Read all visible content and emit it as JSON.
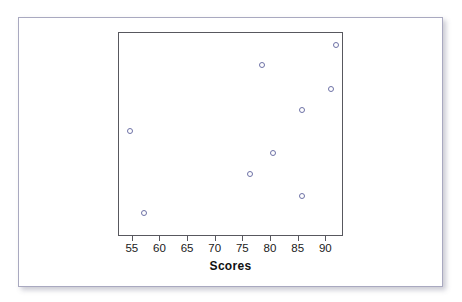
{
  "chart_data": {
    "type": "scatter",
    "title": "",
    "xlabel": "Scores",
    "ylabel": "",
    "xlim": [
      52.5,
      93.2
    ],
    "ylim": [
      0,
      100
    ],
    "grid": false,
    "legend": null,
    "xticks": [
      55,
      60,
      65,
      70,
      75,
      80,
      85,
      90
    ],
    "xtick_labels": [
      "55",
      "60",
      "65",
      "70",
      "75",
      "80",
      "85",
      "90"
    ],
    "yticks": [],
    "ytick_labels": [],
    "marker": {
      "shape": "open-circle",
      "edge_color": "#6e72a6",
      "fill_color": "#ffffff",
      "size_px": 6
    },
    "points": [
      {
        "x": 54.6,
        "y": 51.5
      },
      {
        "x": 57.2,
        "y": 11.3
      },
      {
        "x": 76.4,
        "y": 30.4
      },
      {
        "x": 78.6,
        "y": 83.8
      },
      {
        "x": 80.5,
        "y": 40.7
      },
      {
        "x": 85.8,
        "y": 61.8
      },
      {
        "x": 85.8,
        "y": 19.6
      },
      {
        "x": 91.0,
        "y": 72.1
      },
      {
        "x": 91.9,
        "y": 93.6
      }
    ]
  },
  "colors": {
    "card_border": "#a9a9c0",
    "plot_frame": "#58585e",
    "marker": "#6e72a6",
    "background": "#ffffff",
    "text": "#111111"
  }
}
